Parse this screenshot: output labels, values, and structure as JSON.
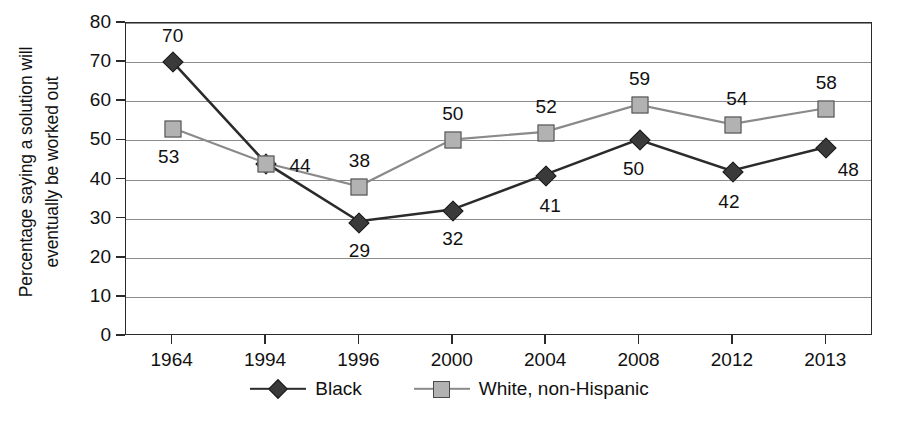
{
  "chart_data": {
    "type": "line",
    "title": "",
    "xlabel": "",
    "ylabel_line1": "Percentage saying a solution will",
    "ylabel_line2": "eventually be worked out",
    "categories": [
      "1964",
      "1994",
      "1996",
      "2000",
      "2004",
      "2008",
      "2012",
      "2013"
    ],
    "ylim": [
      0,
      80
    ],
    "yticks": [
      0,
      10,
      20,
      30,
      40,
      50,
      60,
      70,
      80
    ],
    "ytick_labels": [
      "0",
      "10",
      "20",
      "30",
      "40",
      "50",
      "60",
      "70",
      "80"
    ],
    "grid": true,
    "legend_position": "bottom",
    "series": [
      {
        "name": "Black",
        "marker": "diamond",
        "color": "#3a3a3a",
        "line_color": "#2b2b2b",
        "values": [
          70,
          44,
          29,
          32,
          41,
          50,
          42,
          48
        ],
        "labels": [
          "70",
          "44",
          "29",
          "32",
          "41",
          "50",
          "42",
          "48"
        ]
      },
      {
        "name": "White, non-Hispanic",
        "marker": "square",
        "color": "#b2b2b2",
        "line_color": "#8a8a8a",
        "values": [
          53,
          44,
          38,
          50,
          52,
          59,
          54,
          58
        ],
        "labels": [
          "53",
          "44",
          "38",
          "50",
          "52",
          "59",
          "54",
          "58"
        ]
      }
    ]
  },
  "legend": {
    "items": [
      {
        "label": "Black"
      },
      {
        "label": "White, non-Hispanic"
      }
    ]
  },
  "caption": {
    "text": ""
  }
}
